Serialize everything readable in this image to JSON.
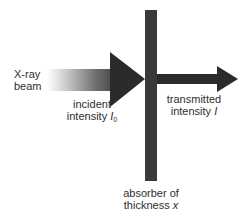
{
  "diagram": {
    "type": "x-ray attenuation schematic",
    "colors": {
      "background": "#ffffff",
      "arrow_dark": "#2b2b2b",
      "absorber": "#3a3a3a",
      "text": "#2e2e2e"
    },
    "source_label": {
      "line1": "X-ray",
      "line2": "beam"
    },
    "incident_label": {
      "line1": "incident",
      "line2_prefix": "intensity ",
      "symbol": "I",
      "subscript": "0"
    },
    "transmitted_label": {
      "line1": "transmitted",
      "line2_prefix": "intensity ",
      "symbol": "I"
    },
    "absorber_label": {
      "line1": "absorber of",
      "line2_prefix": "thickness ",
      "symbol": "x"
    }
  }
}
